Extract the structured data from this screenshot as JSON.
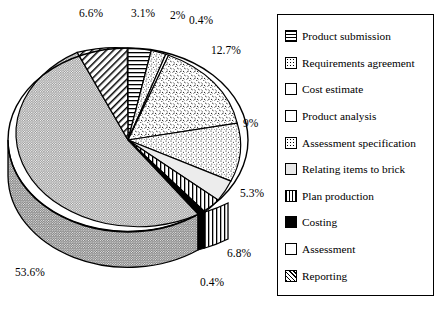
{
  "chart_data": {
    "type": "pie",
    "title": "",
    "three_d": true,
    "start_angle_deg": 0,
    "direction": "clockwise",
    "categories": [
      "Product submission",
      "Requirements agreement",
      "Cost estimate",
      "Product analysis",
      "Assessment specification",
      "Relating items to brick",
      "Plan production",
      "Costing",
      "Assessment",
      "Reporting"
    ],
    "values": [
      3.1,
      2,
      0.4,
      12.7,
      9,
      5.3,
      6.8,
      0.4,
      53.6,
      6.6
    ],
    "value_unit": "%",
    "data_labels": [
      "3.1%",
      "2%",
      "0.4%",
      "12.7%",
      "9%",
      "5.3%",
      "6.8%",
      "0.4%",
      "53.6%",
      "6.6%"
    ],
    "patterns": [
      "horizontal-lines",
      "light-speckle",
      "white",
      "coarse-speckle",
      "fine-speckle",
      "light-gray-plain",
      "vertical-lines",
      "solid-black",
      "fine-dots-gray",
      "diagonal-hatch"
    ],
    "legend_position": "right",
    "grid": false
  },
  "labels": [
    {
      "text": "6.6%",
      "x": 79,
      "y": 8
    },
    {
      "text": "3.1%",
      "x": 131,
      "y": 8
    },
    {
      "text": "2%",
      "x": 170,
      "y": 10
    },
    {
      "text": "0.4%",
      "x": 189,
      "y": 15
    },
    {
      "text": "12.7%",
      "x": 211,
      "y": 45
    },
    {
      "text": "9%",
      "x": 243,
      "y": 118
    },
    {
      "text": "5.3%",
      "x": 240,
      "y": 188
    },
    {
      "text": "6.8%",
      "x": 227,
      "y": 248
    },
    {
      "text": "0.4%",
      "x": 200,
      "y": 277
    },
    {
      "text": "53.6%",
      "x": 15,
      "y": 267
    }
  ],
  "legend": {
    "items": [
      {
        "label": "Product submission",
        "pattern": "pat-hlines"
      },
      {
        "label": "Requirements agreement",
        "pattern": "pat-dots-med"
      },
      {
        "label": "Cost estimate",
        "pattern": "pat-white"
      },
      {
        "label": "Product analysis",
        "pattern": "pat-speckle"
      },
      {
        "label": "Assessment specification",
        "pattern": "pat-dots-med"
      },
      {
        "label": "Relating items to brick",
        "pattern": "pat-lgray"
      },
      {
        "label": "Plan production",
        "pattern": "pat-vlines"
      },
      {
        "label": "Costing",
        "pattern": "pat-black"
      },
      {
        "label": "Assessment",
        "pattern": "pat-dots-fine"
      },
      {
        "label": "Reporting",
        "pattern": "pat-diag"
      }
    ]
  },
  "colors": {
    "outline": "#000000",
    "background": "#ffffff",
    "assessment_fill": "#c9c9c9",
    "costing_fill": "#000000"
  }
}
